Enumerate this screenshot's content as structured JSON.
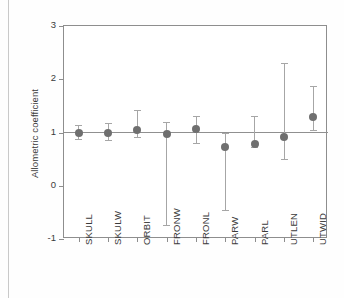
{
  "chart_data": {
    "type": "scatter",
    "title": "",
    "xlabel": "",
    "ylabel": "Allometric coefficient",
    "ylim": [
      -1,
      3
    ],
    "yticks": [
      -1,
      0,
      1,
      2,
      3
    ],
    "ytick_labels": [
      "-1",
      "0",
      "1",
      "2",
      "3"
    ],
    "grid": false,
    "legend": "none",
    "reference_line": 1,
    "categories": [
      "SKULL",
      "SKULW",
      "ORBIT",
      "FRONW",
      "FRONL",
      "PARW",
      "PARL",
      "UTLEN",
      "UTWID"
    ],
    "values": [
      1.0,
      1.0,
      1.04,
      0.97,
      1.07,
      0.72,
      0.78,
      0.91,
      1.3
    ],
    "ci_low": [
      0.88,
      0.86,
      0.91,
      -0.74,
      0.8,
      -0.46,
      0.72,
      0.51,
      1.05
    ],
    "ci_high": [
      1.14,
      1.17,
      1.42,
      1.19,
      1.31,
      1.0,
      1.31,
      2.3,
      1.88
    ],
    "series": [
      {
        "name": "Allometric coefficient",
        "points": [
          {
            "category": "SKULL",
            "value": 1.0,
            "ci_low": 0.88,
            "ci_high": 1.14
          },
          {
            "category": "SKULW",
            "value": 1.0,
            "ci_low": 0.86,
            "ci_high": 1.17
          },
          {
            "category": "ORBIT",
            "value": 1.04,
            "ci_low": 0.91,
            "ci_high": 1.42
          },
          {
            "category": "FRONW",
            "value": 0.97,
            "ci_low": -0.74,
            "ci_high": 1.19
          },
          {
            "category": "FRONL",
            "value": 1.07,
            "ci_low": 0.8,
            "ci_high": 1.31
          },
          {
            "category": "PARW",
            "value": 0.72,
            "ci_low": -0.46,
            "ci_high": 1.0
          },
          {
            "category": "PARL",
            "value": 0.78,
            "ci_low": 0.72,
            "ci_high": 1.31
          },
          {
            "category": "UTLEN",
            "value": 0.91,
            "ci_low": 0.51,
            "ci_high": 2.3
          },
          {
            "category": "UTWID",
            "value": 1.3,
            "ci_low": 1.05,
            "ci_high": 1.88
          }
        ]
      }
    ],
    "colors": {
      "marker": "#6f6f6f",
      "errorbar": "#a6a6a6",
      "axis": "#8e8e8e",
      "reference_line": "#909090",
      "text": "#3b3b3b",
      "background": "#ffffff"
    }
  }
}
